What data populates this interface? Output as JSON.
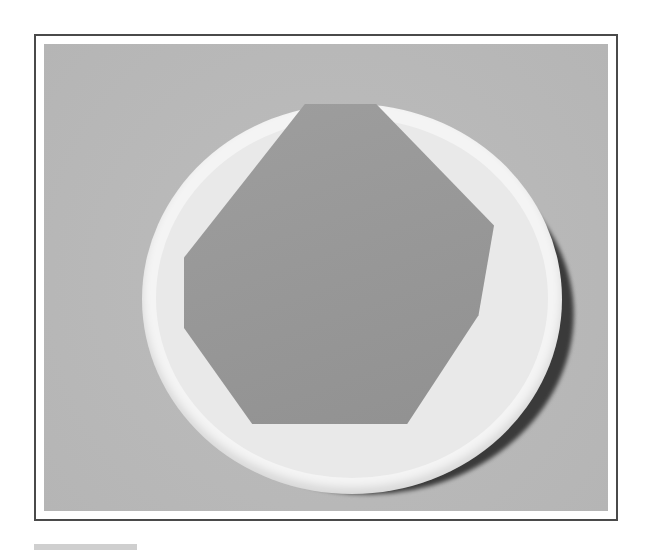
{
  "figure": {
    "frame_color": "#4a4a4a",
    "background_color": "#b9b9b9",
    "bowl_color": "#f4f4f4",
    "object_color": "#9a9a9a"
  }
}
